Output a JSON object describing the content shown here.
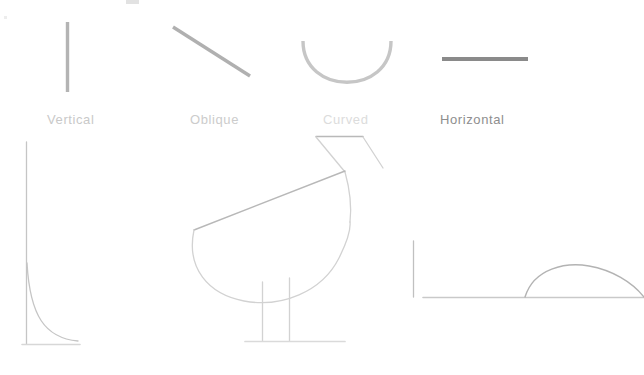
{
  "canvas": {
    "width": 644,
    "height": 375,
    "background": "#ffffff"
  },
  "legend": {
    "title": "",
    "items": [
      {
        "label": "Vertical",
        "label_color": "#c9c9c9",
        "stroke_color": "#b4b4b4",
        "stroke_name": "vertical-stroke-sample"
      },
      {
        "label": "Oblique",
        "label_color": "#cccccc",
        "stroke_color": "#b0b0b0",
        "stroke_name": "oblique-stroke-sample"
      },
      {
        "label": "Curved",
        "label_color": "#dcdcdc",
        "stroke_color": "#c6c6c6",
        "stroke_name": "curved-stroke-sample"
      },
      {
        "label": "Horizontal",
        "label_color": "#8e8e8e",
        "stroke_color": "#8a8a8a",
        "stroke_name": "horizontal-stroke-sample"
      }
    ]
  },
  "figures": [
    {
      "name": "left-corner-figure",
      "description": "vertical line joined by a curve to a short horizontal base",
      "stroke_color": "#c5c5c5"
    },
    {
      "name": "bird-figure",
      "description": "outline of a bird with triangular head, curved body and two legs",
      "stroke_color": "#d2d2d2"
    },
    {
      "name": "right-arch-figure",
      "description": "vertical line, long horizontal baseline and an arch",
      "stroke_color": "#c0c0c0"
    }
  ],
  "colors": {
    "background": "#ffffff",
    "light_gray": "#d9d9d9",
    "mid_gray": "#b4b4b4",
    "dark_gray": "#8a8a8a"
  }
}
